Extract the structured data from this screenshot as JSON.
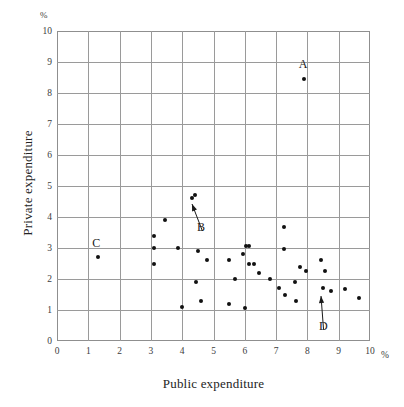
{
  "chart_data": {
    "type": "scatter",
    "title": "",
    "xlabel": "Public expenditure",
    "ylabel": "Private expenditure",
    "unit_symbol": "%",
    "x_unit_suffix": "%",
    "xlim": [
      0,
      10
    ],
    "ylim": [
      0,
      10
    ],
    "xticks": [
      0,
      1,
      2,
      3,
      4,
      5,
      6,
      7,
      8,
      9,
      10
    ],
    "yticks": [
      0,
      1,
      2,
      3,
      4,
      5,
      6,
      7,
      8,
      9,
      10
    ],
    "grid": true,
    "legend": "none",
    "marker_color": "#111111",
    "grid_color": "#9a9a9a",
    "points": [
      {
        "x": 1.3,
        "y": 2.7
      },
      {
        "x": 3.1,
        "y": 3.4
      },
      {
        "x": 3.1,
        "y": 3.0
      },
      {
        "x": 3.1,
        "y": 2.5
      },
      {
        "x": 3.45,
        "y": 3.9
      },
      {
        "x": 3.85,
        "y": 3.0
      },
      {
        "x": 4.0,
        "y": 1.1
      },
      {
        "x": 4.3,
        "y": 4.6
      },
      {
        "x": 4.4,
        "y": 4.7
      },
      {
        "x": 4.5,
        "y": 2.9
      },
      {
        "x": 4.45,
        "y": 1.9
      },
      {
        "x": 4.6,
        "y": 1.3
      },
      {
        "x": 4.8,
        "y": 2.6
      },
      {
        "x": 5.5,
        "y": 2.6
      },
      {
        "x": 5.5,
        "y": 1.2
      },
      {
        "x": 5.7,
        "y": 2.0
      },
      {
        "x": 5.95,
        "y": 2.8
      },
      {
        "x": 6.05,
        "y": 3.07
      },
      {
        "x": 6.15,
        "y": 3.07
      },
      {
        "x": 6.0,
        "y": 1.08
      },
      {
        "x": 6.15,
        "y": 2.5
      },
      {
        "x": 6.3,
        "y": 2.5
      },
      {
        "x": 6.45,
        "y": 2.2
      },
      {
        "x": 6.8,
        "y": 2.0
      },
      {
        "x": 7.1,
        "y": 1.7
      },
      {
        "x": 7.25,
        "y": 3.68
      },
      {
        "x": 7.25,
        "y": 2.98
      },
      {
        "x": 7.3,
        "y": 1.5
      },
      {
        "x": 7.6,
        "y": 1.9
      },
      {
        "x": 7.65,
        "y": 1.3
      },
      {
        "x": 7.75,
        "y": 2.4
      },
      {
        "x": 7.9,
        "y": 8.45
      },
      {
        "x": 7.95,
        "y": 2.27
      },
      {
        "x": 8.45,
        "y": 2.6
      },
      {
        "x": 8.5,
        "y": 1.7
      },
      {
        "x": 8.55,
        "y": 2.27
      },
      {
        "x": 8.75,
        "y": 1.6
      },
      {
        "x": 9.2,
        "y": 1.68
      },
      {
        "x": 9.65,
        "y": 1.38
      }
    ],
    "annotations": [
      {
        "label": "A",
        "label_x": 7.85,
        "label_y": 8.95,
        "target_x": 7.9,
        "target_y": 8.45,
        "has_arrow": false
      },
      {
        "label": "B",
        "label_x": 4.6,
        "label_y": 3.68,
        "target_x": 4.3,
        "target_y": 4.42,
        "has_arrow": true
      },
      {
        "label": "C",
        "label_x": 1.25,
        "label_y": 3.15,
        "target_x": 1.3,
        "target_y": 2.7,
        "has_arrow": false
      },
      {
        "label": "D",
        "label_x": 8.5,
        "label_y": 0.5,
        "target_x": 8.45,
        "target_y": 1.46,
        "has_arrow": true
      }
    ]
  }
}
